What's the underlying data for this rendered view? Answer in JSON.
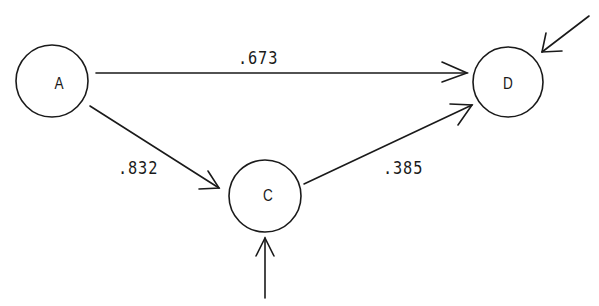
{
  "diagram": {
    "type": "path-diagram",
    "nodes": [
      {
        "id": "A",
        "label": "A",
        "cx": 52,
        "cy": 81,
        "r": 36
      },
      {
        "id": "C",
        "label": "C",
        "cx": 265,
        "cy": 196,
        "r": 36
      },
      {
        "id": "D",
        "label": "D",
        "cx": 508,
        "cy": 82,
        "r": 35
      }
    ],
    "edges": [
      {
        "from": "A",
        "to": "D",
        "label": ".673"
      },
      {
        "from": "A",
        "to": "C",
        "label": ".832"
      },
      {
        "from": "C",
        "to": "D",
        "label": ".385"
      }
    ],
    "external_inputs": [
      {
        "to": "C",
        "label": ""
      },
      {
        "to": "D",
        "label": ""
      }
    ]
  },
  "colors": {
    "stroke": "#1a1a1a",
    "background": "#ffffff"
  }
}
